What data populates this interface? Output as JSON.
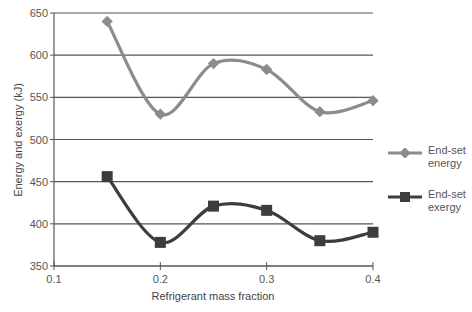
{
  "chart_data": {
    "type": "line",
    "title": "",
    "xlabel": "Refrigerant mass fraction",
    "ylabel": "Energy and exergy (kJ)",
    "xlim": [
      0.1,
      0.4
    ],
    "ylim": [
      350,
      650
    ],
    "x_ticks": [
      "0.1",
      "0.2",
      "0.3",
      "0.4"
    ],
    "y_ticks": [
      "350",
      "400",
      "450",
      "500",
      "550",
      "600",
      "650"
    ],
    "grid": "horizontal",
    "legend_position": "right",
    "x": [
      0.15,
      0.2,
      0.25,
      0.3,
      0.35,
      0.4
    ],
    "series": [
      {
        "name": "End-set energy",
        "marker": "diamond",
        "color": "#8c8c8c",
        "values": [
          640,
          530,
          590,
          583,
          533,
          546
        ]
      },
      {
        "name": "End-set exergy",
        "marker": "square",
        "color": "#3d3d3d",
        "values": [
          456,
          378,
          421,
          416,
          380,
          390
        ]
      }
    ]
  },
  "legend": {
    "energy_line1": "End-set",
    "energy_line2": "energy",
    "exergy_line1": "End-set",
    "exergy_line2": "exergy"
  }
}
